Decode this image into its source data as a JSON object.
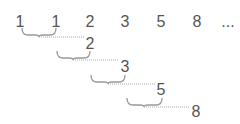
{
  "diagram": {
    "sequence": [
      {
        "label": "1",
        "x": 20,
        "y": 22
      },
      {
        "label": "1",
        "x": 56,
        "y": 22
      },
      {
        "label": "2",
        "x": 90,
        "y": 22
      },
      {
        "label": "3",
        "x": 125,
        "y": 22
      },
      {
        "label": "5",
        "x": 161,
        "y": 22
      },
      {
        "label": "8",
        "x": 197,
        "y": 22
      },
      {
        "label": "...",
        "x": 228,
        "y": 22
      }
    ],
    "sums": [
      {
        "label": "2",
        "x": 90,
        "y": 44,
        "brace": {
          "x1": 22,
          "x2": 56,
          "y": 28
        },
        "tip": {
          "x": 39,
          "y": 37
        },
        "line_end": 84
      },
      {
        "label": "3",
        "x": 125,
        "y": 67,
        "brace": {
          "x1": 57,
          "x2": 90,
          "y": 51
        },
        "tip": {
          "x": 73,
          "y": 60
        },
        "line_end": 119
      },
      {
        "label": "5",
        "x": 161,
        "y": 90,
        "brace": {
          "x1": 91,
          "x2": 125,
          "y": 75
        },
        "tip": {
          "x": 108,
          "y": 84
        },
        "line_end": 155
      },
      {
        "label": "8",
        "x": 196,
        "y": 112,
        "brace": {
          "x1": 127,
          "x2": 162,
          "y": 98
        },
        "tip": {
          "x": 144,
          "y": 107
        },
        "line_end": 190
      }
    ],
    "colors": {
      "text": "#555555",
      "brace": "#999999",
      "dotted": "#aaaaaa"
    }
  }
}
